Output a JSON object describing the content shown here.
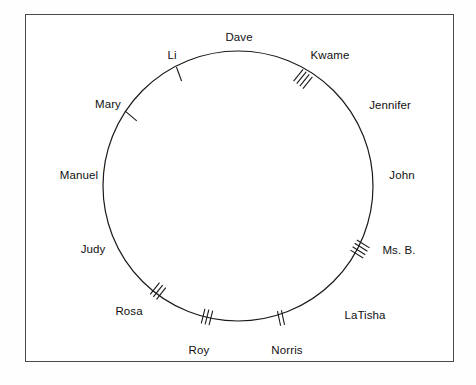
{
  "figure": {
    "type": "sociogram-circle-diagram",
    "frame": {
      "border_color": "#4a4a4a",
      "background_color": "#ffffff"
    },
    "circle": {
      "center_x": 238,
      "center_y": 186,
      "radius": 135,
      "stroke_color": "#1a1a1a",
      "stroke_width": 1.2,
      "fill": "none"
    },
    "names": [
      {
        "label": "Dave",
        "angle_deg": 270,
        "label_x": 239,
        "label_y": 38,
        "align": "center"
      },
      {
        "label": "Kwame",
        "angle_deg": 305,
        "label_x": 330,
        "label_y": 56,
        "align": "center"
      },
      {
        "label": "Jennifer",
        "angle_deg": 334,
        "label_x": 390,
        "label_y": 106,
        "align": "center"
      },
      {
        "label": "John",
        "angle_deg": 3,
        "label_x": 402,
        "label_y": 176,
        "align": "center"
      },
      {
        "label": "Ms. B.",
        "angle_deg": 33,
        "label_x": 399,
        "label_y": 251,
        "align": "center"
      },
      {
        "label": "LaTisha",
        "angle_deg": 57,
        "label_x": 365,
        "label_y": 316,
        "align": "center"
      },
      {
        "label": "Norris",
        "angle_deg": 80,
        "label_x": 287,
        "label_y": 351,
        "align": "center"
      },
      {
        "label": "Roy",
        "angle_deg": 97,
        "label_x": 199,
        "label_y": 351,
        "align": "center"
      },
      {
        "label": "Rosa",
        "angle_deg": 122,
        "label_x": 129,
        "label_y": 312,
        "align": "center"
      },
      {
        "label": "Judy",
        "angle_deg": 152,
        "label_x": 93,
        "label_y": 250,
        "align": "center"
      },
      {
        "label": "Manuel",
        "angle_deg": 180,
        "label_x": 79,
        "label_y": 176,
        "align": "center"
      },
      {
        "label": "Mary",
        "angle_deg": 207,
        "label_x": 108,
        "label_y": 105,
        "align": "center"
      },
      {
        "label": "Li",
        "angle_deg": 242,
        "label_x": 172,
        "label_y": 56,
        "align": "center"
      }
    ],
    "tally_groups": [
      {
        "between": "Li-Dave",
        "count": 1,
        "angle_deg": 250,
        "x": 179,
        "y": 74
      },
      {
        "between": "Dave-Kwame",
        "count": 4,
        "angle_deg": 309,
        "x": 303,
        "y": 79
      },
      {
        "between": "Mary-Li",
        "count": 1,
        "angle_deg": 220,
        "x": 131,
        "y": 116
      },
      {
        "between": "John-Ms. B.",
        "count": 4,
        "angle_deg": 32,
        "x": 360,
        "y": 249
      },
      {
        "between": "Rosa-Judy",
        "count": 3,
        "angle_deg": 128,
        "x": 158,
        "y": 291
      },
      {
        "between": "Roy-Rosa",
        "count": 3,
        "angle_deg": 104,
        "x": 207,
        "y": 317
      },
      {
        "between": "Norris-Roy",
        "count": 2,
        "angle_deg": 78,
        "x": 281,
        "y": 318
      }
    ]
  }
}
